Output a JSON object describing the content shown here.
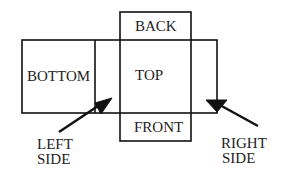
{
  "diagram": {
    "type": "box net / unfolded cube layout",
    "labels": {
      "back": "BACK",
      "bottom": "BOTTOM",
      "top": "TOP",
      "front": "FRONT",
      "left_side_line1": "LEFT",
      "left_side_line2": "SIDE",
      "right_side_line1": "RIGHT",
      "right_side_line2": "SIDE"
    },
    "colors": {
      "stroke": "#111111",
      "text": "#222222",
      "background": "#ffffff"
    }
  }
}
